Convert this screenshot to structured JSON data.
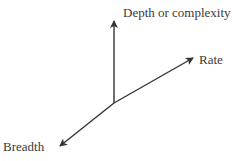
{
  "diagram": {
    "type": "3-axis vector diagram",
    "axes": [
      {
        "label": "Depth or complexity",
        "direction": "up"
      },
      {
        "label": "Rate",
        "direction": "up-right"
      },
      {
        "label": "Breadth",
        "direction": "down-left"
      }
    ],
    "colors": {
      "line": "#333333",
      "text": "#3a3a3a",
      "background": "#ffffff"
    }
  }
}
